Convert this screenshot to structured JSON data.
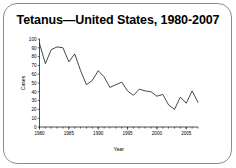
{
  "slide": {
    "title": "Tetanus—United States, 1980-2007",
    "frame_color": "#8d8d8d",
    "background_color": "#ffffff"
  },
  "chart_data": {
    "type": "line",
    "title": "Tetanus—United States, 1980-2007",
    "xlabel": "Year",
    "ylabel": "Cases",
    "xlim": [
      1980,
      2007
    ],
    "ylim": [
      0,
      100
    ],
    "ytick_step": 10,
    "yticks": [
      0,
      10,
      20,
      30,
      40,
      50,
      60,
      70,
      80,
      90,
      100
    ],
    "ytick_labels": [
      "0",
      "10",
      "20",
      "30",
      "40",
      "50",
      "60",
      "70",
      "80",
      "90",
      "100"
    ],
    "xticks": [
      1980,
      1985,
      1990,
      1995,
      2000,
      2005
    ],
    "xtick_labels": [
      "1980",
      "1985",
      "1990",
      "1995",
      "2000",
      "2005"
    ],
    "x_minor_tick_step": 1,
    "grid": false,
    "legend": false,
    "line_color": "#1a1a1a",
    "x": [
      1980,
      1981,
      1982,
      1983,
      1984,
      1985,
      1986,
      1987,
      1988,
      1989,
      1990,
      1991,
      1992,
      1993,
      1994,
      1995,
      1996,
      1997,
      1998,
      1999,
      2000,
      2001,
      2002,
      2003,
      2004,
      2005,
      2006,
      2007
    ],
    "values": [
      95,
      72,
      88,
      91,
      90,
      74,
      83,
      64,
      48,
      53,
      64,
      57,
      45,
      48,
      51,
      41,
      36,
      43,
      41,
      40,
      35,
      37,
      25,
      20,
      34,
      27,
      41,
      28
    ],
    "series": [
      {
        "name": "Cases",
        "values": [
          95,
          72,
          88,
          91,
          90,
          74,
          83,
          64,
          48,
          53,
          64,
          57,
          45,
          48,
          51,
          41,
          36,
          43,
          41,
          40,
          35,
          37,
          25,
          20,
          34,
          27,
          41,
          28
        ]
      }
    ]
  }
}
